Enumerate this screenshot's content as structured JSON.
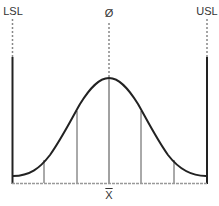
{
  "labels": {
    "lsl": "LSL",
    "usl": "USL",
    "target": "Ø",
    "mean": "X"
  },
  "colors": {
    "line": "#222222",
    "thin_line": "#555555",
    "dotted": "#888888",
    "baseline": "#999999"
  },
  "diagram": {
    "type": "normal-distribution-with-spec-limits",
    "spec_limits": [
      "LSL",
      "USL"
    ],
    "center_marker": "Ø",
    "mean_marker": "X-bar",
    "sigma_divisions": 4
  }
}
